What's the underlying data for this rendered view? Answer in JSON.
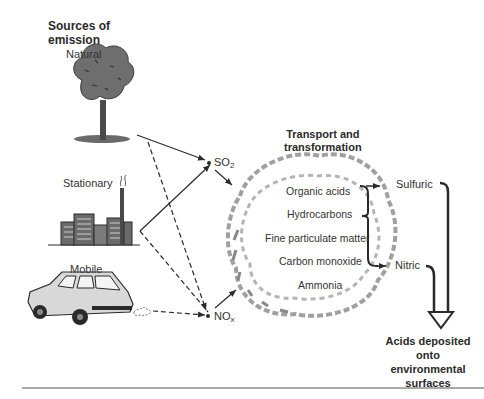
{
  "diagram": {
    "sources": {
      "heading_line1": "Sources of",
      "heading_line2": "emission",
      "natural": "Natural",
      "stationary": "Stationary",
      "mobile": "Mobile"
    },
    "pollutants": {
      "so2_base": "SO",
      "so2_sub": "2",
      "nox_base": "NO",
      "nox_sub": "x"
    },
    "transport": {
      "heading_line1": "Transport and",
      "heading_line2": "transformation",
      "items": [
        "Organic acids",
        "Hydrocarbons",
        "Fine particulate matter",
        "Carbon monoxide",
        "Ammonia"
      ]
    },
    "acids": {
      "sulfuric": "Sulfuric",
      "nitric": "Nitric"
    },
    "deposition": {
      "line1": "Acids deposited",
      "line2": "onto",
      "line3": "environmental",
      "line4": "surfaces"
    },
    "icons": [
      "tree-icon",
      "factory-icon",
      "car-icon",
      "cloud-icon"
    ],
    "colors": {
      "ink": "#2a2a2a",
      "fill_gray": "#7a7a7a",
      "cloud_gray": "#9a9a9a",
      "rule": "#555555"
    }
  }
}
